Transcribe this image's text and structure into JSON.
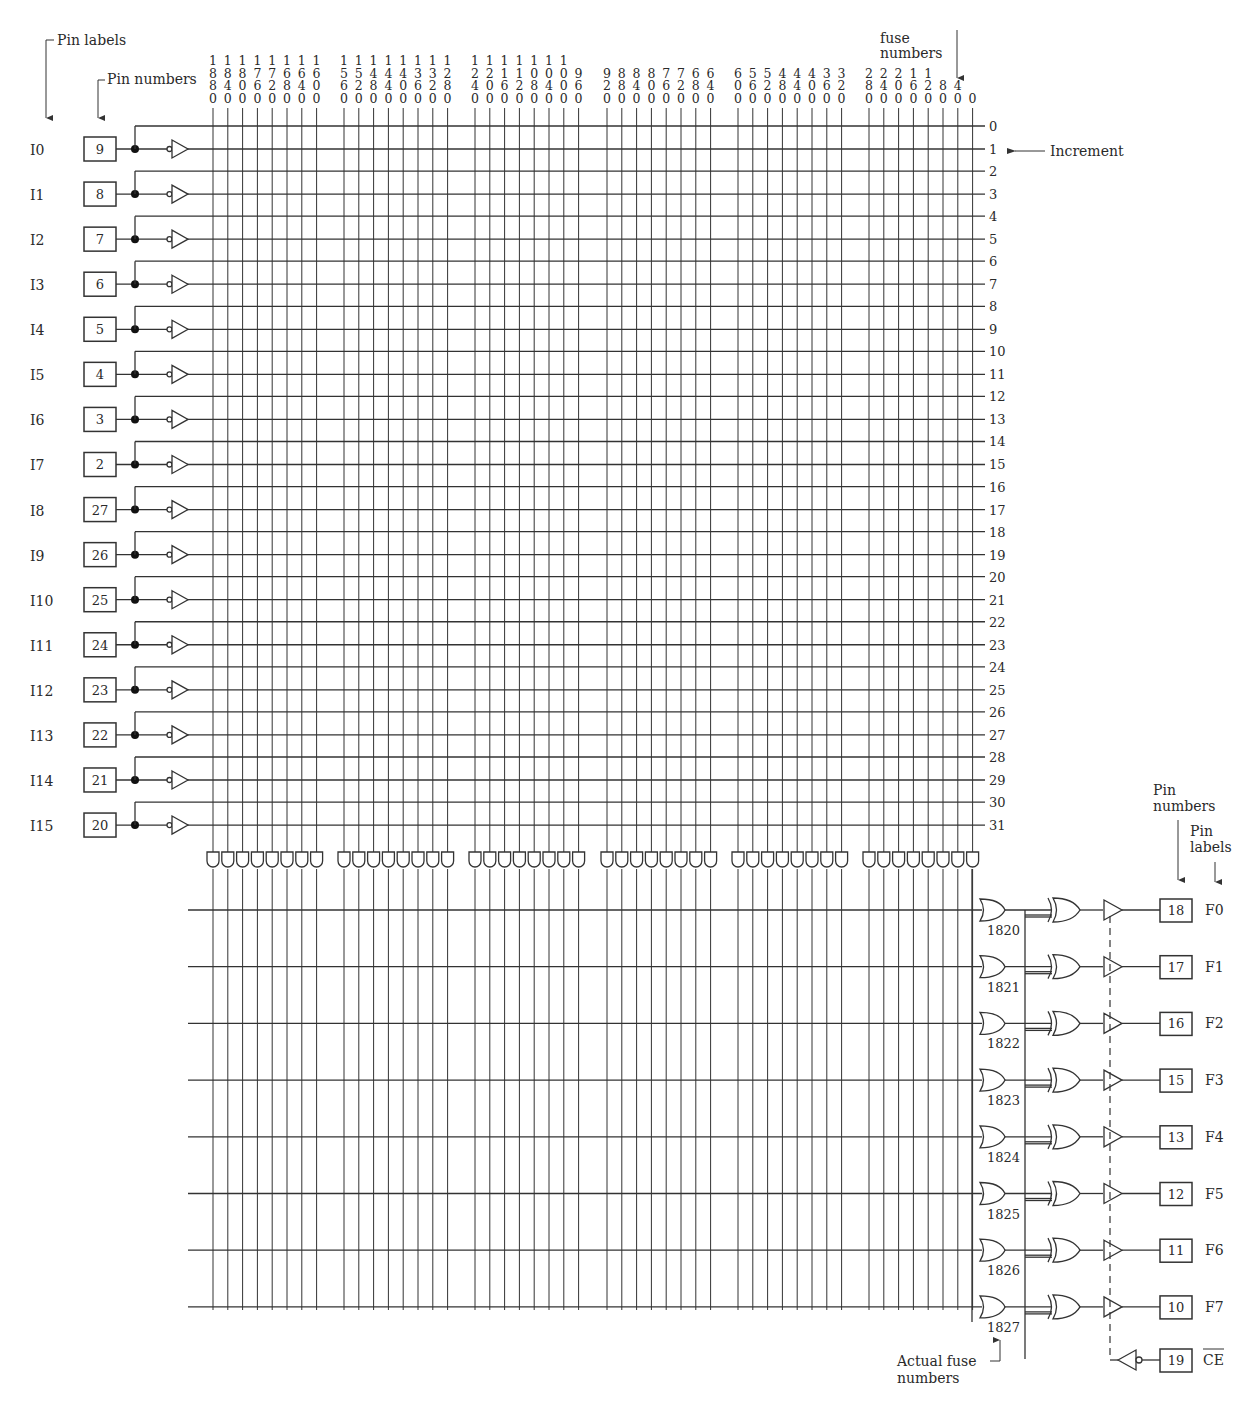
{
  "annotations": {
    "pin_labels_top": "Pin labels",
    "pin_numbers_top": "Pin numbers",
    "fuse_numbers_line1": "fuse",
    "fuse_numbers_line2": "numbers",
    "increment": "Increment",
    "pin_numbers_right_line1": "Pin",
    "pin_numbers_right_line2": "numbers",
    "pin_labels_right_line1": "Pin",
    "pin_labels_right_line2": "labels",
    "actual_fuse_line1": "Actual fuse",
    "actual_fuse_line2": "numbers"
  },
  "inputs": [
    {
      "label": "I0",
      "pin": "9"
    },
    {
      "label": "I1",
      "pin": "8"
    },
    {
      "label": "I2",
      "pin": "7"
    },
    {
      "label": "I3",
      "pin": "6"
    },
    {
      "label": "I4",
      "pin": "5"
    },
    {
      "label": "I5",
      "pin": "4"
    },
    {
      "label": "I6",
      "pin": "3"
    },
    {
      "label": "I7",
      "pin": "2"
    },
    {
      "label": "I8",
      "pin": "27"
    },
    {
      "label": "I9",
      "pin": "26"
    },
    {
      "label": "I10",
      "pin": "25"
    },
    {
      "label": "I11",
      "pin": "24"
    },
    {
      "label": "I12",
      "pin": "23"
    },
    {
      "label": "I13",
      "pin": "22"
    },
    {
      "label": "I14",
      "pin": "21"
    },
    {
      "label": "I15",
      "pin": "20"
    }
  ],
  "column_fuse_numbers": [
    [
      "1880",
      "1840",
      "1800",
      "1760",
      "1720",
      "1680",
      "1640",
      "1600"
    ],
    [
      "1560",
      "1520",
      "1480",
      "1440",
      "1400",
      "1360",
      "1320",
      "1280"
    ],
    [
      "1240",
      "1200",
      "1160",
      "1120",
      "1080",
      "1040",
      "1000",
      "960"
    ],
    [
      "920",
      "880",
      "840",
      "800",
      "760",
      "720",
      "680",
      "640"
    ],
    [
      "600",
      "560",
      "520",
      "480",
      "440",
      "400",
      "360",
      "320"
    ],
    [
      "280",
      "240",
      "200",
      "160",
      "120",
      "80",
      "40",
      "0"
    ]
  ],
  "row_increments": [
    "0",
    "1",
    "2",
    "3",
    "4",
    "5",
    "6",
    "7",
    "8",
    "9",
    "10",
    "11",
    "12",
    "13",
    "14",
    "15",
    "16",
    "17",
    "18",
    "19",
    "20",
    "21",
    "22",
    "23",
    "24",
    "25",
    "26",
    "27",
    "28",
    "29",
    "30",
    "31"
  ],
  "outputs": [
    {
      "label": "F0",
      "pin": "18",
      "or_fuse": "1820"
    },
    {
      "label": "F1",
      "pin": "17",
      "or_fuse": "1821"
    },
    {
      "label": "F2",
      "pin": "16",
      "or_fuse": "1822"
    },
    {
      "label": "F3",
      "pin": "15",
      "or_fuse": "1823"
    },
    {
      "label": "F4",
      "pin": "13",
      "or_fuse": "1824"
    },
    {
      "label": "F5",
      "pin": "12",
      "or_fuse": "1825"
    },
    {
      "label": "F6",
      "pin": "11",
      "or_fuse": "1826"
    },
    {
      "label": "F7",
      "pin": "10",
      "or_fuse": "1827"
    }
  ],
  "chip_enable": {
    "label": "CE",
    "pin": "19",
    "active_low": true
  }
}
